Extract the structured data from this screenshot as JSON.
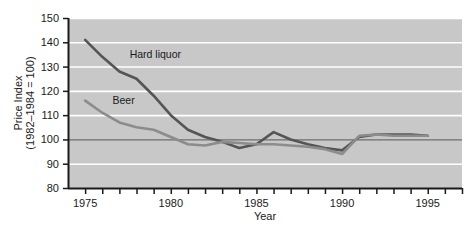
{
  "chart_data": {
    "type": "line",
    "title": "",
    "xlabel": "Year",
    "ylabel_line1": "Price Index",
    "ylabel_line2": "(1982–1984 = 100)",
    "xlim": [
      1974,
      1997
    ],
    "ylim": [
      80,
      150
    ],
    "ytick_labels": [
      "80",
      "90",
      "100",
      "110",
      "120",
      "130",
      "140",
      "150"
    ],
    "ytick_values": [
      80,
      90,
      100,
      110,
      120,
      130,
      140,
      150
    ],
    "xtick_values": [
      1974,
      1975,
      1976,
      1977,
      1978,
      1979,
      1980,
      1981,
      1982,
      1983,
      1984,
      1985,
      1986,
      1987,
      1988,
      1989,
      1990,
      1991,
      1992,
      1993,
      1994,
      1995,
      1996,
      1997
    ],
    "xtick_labels_shown": [
      {
        "value": 1975,
        "label": "1975"
      },
      {
        "value": 1980,
        "label": "1980"
      },
      {
        "value": 1985,
        "label": "1985"
      },
      {
        "value": 1990,
        "label": "1990"
      },
      {
        "value": 1995,
        "label": "1995"
      }
    ],
    "grid": "horizontal-white",
    "plot_background": "#c8c8c8",
    "gridline_color": "#ffffff",
    "reference_line": {
      "value": 100,
      "color": "#6e6e6e"
    },
    "legend": "inline-labels",
    "x": [
      1975,
      1976,
      1977,
      1978,
      1979,
      1980,
      1981,
      1982,
      1983,
      1984,
      1985,
      1986,
      1987,
      1988,
      1989,
      1990,
      1991,
      1992,
      1993,
      1994,
      1995
    ],
    "series": [
      {
        "name": "Hard liquor",
        "color": "#555555",
        "label_x": 1977.6,
        "label_y": 133.5,
        "values": [
          141,
          134,
          128,
          125,
          118,
          110,
          104,
          101,
          99,
          96.5,
          98,
          103,
          100,
          98,
          96.5,
          95.5,
          101,
          102,
          102,
          102,
          101.5
        ]
      },
      {
        "name": "Beer",
        "color": "#8c8c8c",
        "label_x": 1976.6,
        "label_y": 114.5,
        "values": [
          116,
          111,
          107,
          105,
          104,
          101,
          98,
          97.5,
          99,
          98.5,
          98,
          98,
          97.5,
          97,
          96,
          94,
          101.5,
          102,
          101.5,
          101.5,
          101.5
        ]
      }
    ]
  }
}
